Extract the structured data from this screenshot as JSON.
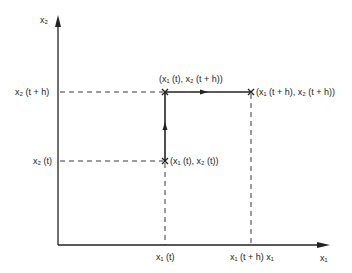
{
  "axes": {
    "x_label": "x₁",
    "y_label": "x₂"
  },
  "ticks": {
    "y_top": "x₂ (t + h)",
    "y_bottom": "x₂ (t)",
    "x_left": "x₁ (t)",
    "x_right": "x₁ (t + h) x₁"
  },
  "points": {
    "start": "(x₁ (t), x₂ (t))",
    "middle": "(x₁ (t), x₂ (t + h))",
    "end": "(x₁ (t + h), x₂ (t + h))"
  },
  "colors": {
    "line": "#222222",
    "background": "#ffffff"
  }
}
